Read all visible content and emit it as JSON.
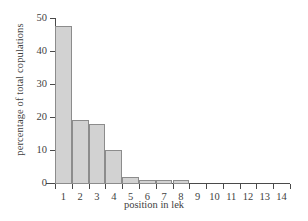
{
  "chart_data": {
    "type": "bar",
    "title": "",
    "xlabel": "position in lek",
    "ylabel": "percentage of total copulations",
    "categories": [
      "1",
      "2",
      "3",
      "4",
      "5",
      "6",
      "7",
      "8",
      "9",
      "10",
      "11",
      "12",
      "13",
      "14"
    ],
    "values": [
      48,
      19.3,
      18.3,
      10.4,
      2.2,
      1.1,
      1.1,
      1.1,
      0,
      0,
      0,
      0,
      0,
      0
    ],
    "xlim": [
      0.5,
      14.5
    ],
    "ylim": [
      0,
      50
    ],
    "yticks": [
      0,
      10,
      20,
      30,
      40,
      50
    ],
    "ytick_labels": [
      "0",
      "10",
      "20",
      "30",
      "40",
      "50"
    ],
    "xticks": [
      1,
      2,
      3,
      4,
      5,
      6,
      7,
      8,
      9,
      10,
      11,
      12,
      13,
      14
    ],
    "grid": false,
    "legend": null,
    "bar_fill_color": "#d2d2d2",
    "bar_edge_color": "#8c8c8c",
    "axis_color": "#4a4a4a",
    "background_color": "#ffffff"
  }
}
